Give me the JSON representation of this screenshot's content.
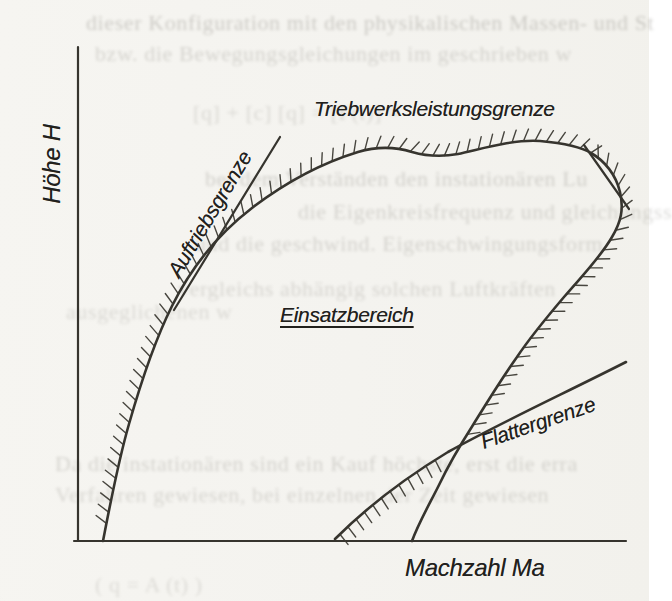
{
  "figure": {
    "type": "flight-envelope-diagram",
    "background_color": "#f4f3ef",
    "ink_color": "#36342e"
  },
  "labels": {
    "y_axis": "Höhe H",
    "x_axis": "Machzahl Ma",
    "engine_limit": "Triebwerksleistungsgrenze",
    "lift_limit": "Auftriebsgrenze",
    "flutter_limit": "Flattergrenze",
    "operating_region": "Einsatzbereich"
  },
  "diagram": {
    "curves": {
      "y_axis": {
        "d": "M 78 47 L 78 541"
      },
      "x_axis": {
        "d": "M 74 541 L 626 541"
      },
      "envelope": {
        "d": "M 103 541 C 110 505 118 462 129 424 C 141 382 154 342 172 306 C 192 266 218 234 252 208 C 286 182 322 163 358 152 C 378 146 396 147 412 152 C 426 156 442 157 458 154 C 478 150 512 139 540 141 C 562 143 580 146 591 153 C 605 161 616 175 620 192 C 624 209 621 222 612 237 C 600 258 581 277 564 297 C 547 317 531 336 517 357 C 500 381 486 404 473 425 C 459 447 448 466 439 485 C 429 505 419 522 412 541"
      },
      "lift_line": {
        "d": "M 174 310 L 280 137"
      },
      "upper_tangent": {
        "d": "M 584 145 L 629 209"
      },
      "flutter_line": {
        "d": "M 335 539 C 368 506 405 478 448 452 C 500 423 565 393 626 362"
      }
    },
    "hatches": [
      {
        "curve": "envelope",
        "start": 0.015,
        "end": 0.62,
        "side": "left",
        "spacing": 11.5,
        "len": 13,
        "lean": 0.5
      },
      {
        "curve": "envelope",
        "start": 0.62,
        "end": 0.905,
        "side": "left",
        "spacing": 11.5,
        "len": 13,
        "lean": -0.85
      },
      {
        "curve": "flutter_line",
        "start": 0.02,
        "end": 0.4,
        "side": "right",
        "spacing": 11,
        "len": 13,
        "lean": -0.1
      }
    ]
  },
  "bleedthrough": [
    {
      "text": "dieser Konfiguration mit den physikalischen Massen- und St",
      "x": 86,
      "y": 10,
      "size": 22,
      "opacity": 0.3
    },
    {
      "text": "bzw. die Bewegungsgleichungen im geschrieben w",
      "x": 95,
      "y": 41,
      "size": 22,
      "opacity": 0.24
    },
    {
      "text": "[q] + [c] [q] = [F(t)] =",
      "x": 193,
      "y": 100,
      "size": 22,
      "opacity": 0.2
    },
    {
      "text": "bei dem Verständen den instationären Lu",
      "x": 205,
      "y": 166,
      "size": 22,
      "opacity": 0.26
    },
    {
      "text": "die Eigenkreisfrequenz und gleichungss",
      "x": 298,
      "y": 199,
      "size": 22,
      "opacity": 0.24
    },
    {
      "text": "und die geschwind. Eigenschwingungsform",
      "x": 195,
      "y": 231,
      "size": 22,
      "opacity": 0.24
    },
    {
      "text": "vergleichs abhängig solchen Luftkräften",
      "x": 178,
      "y": 276,
      "size": 22,
      "opacity": 0.22
    },
    {
      "text": "ausgeglichenen w",
      "x": 66,
      "y": 299,
      "size": 22,
      "opacity": 0.2
    },
    {
      "text": "Da die instationären sind ein Kauf höchste, erst die erra",
      "x": 55,
      "y": 451,
      "size": 22,
      "opacity": 0.24
    },
    {
      "text": "Verfahren gewiesen, bei einzelnen der Zeit gewiesen",
      "x": 55,
      "y": 482,
      "size": 22,
      "opacity": 0.22
    },
    {
      "text": "( q = A (t) )",
      "x": 95,
      "y": 572,
      "size": 22,
      "opacity": 0.18
    }
  ]
}
